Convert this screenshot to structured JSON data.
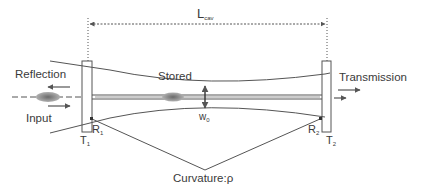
{
  "diagram": {
    "type": "optical-cavity-schematic",
    "labels": {
      "length": "L",
      "length_sub": "cav",
      "reflection": "Reflection",
      "input": "Input",
      "stored": "Stored",
      "transmission": "Transmission",
      "waist": "w",
      "waist_sub": "0",
      "r1": "R",
      "r1_sub": "1",
      "r2": "R",
      "r2_sub": "2",
      "t1": "T",
      "t1_sub": "1",
      "t2": "T",
      "t2_sub": "2",
      "curvature": "Curvature:ρ"
    },
    "colors": {
      "line": "#555555",
      "text": "#3a3a3a",
      "pulse": "#7a7a7a"
    }
  }
}
